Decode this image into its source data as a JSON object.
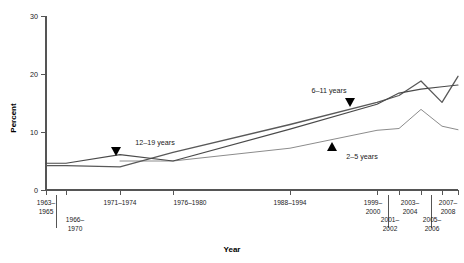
{
  "chart_data": {
    "type": "line",
    "title": "",
    "xlabel": "Year",
    "ylabel": "Percent",
    "ylim": [
      0,
      30
    ],
    "yticks": [
      0,
      10,
      20,
      30
    ],
    "ytick_labels": [
      "0",
      "10",
      "20",
      "30"
    ],
    "grid": false,
    "legend": "inline-annotations",
    "categories": [
      "1963–1965",
      "1966–1970",
      "1971–1974",
      "1976–1980",
      "1988–1994",
      "1999–2000",
      "2001–2002",
      "2003–2004",
      "2005–2006",
      "2007–2008"
    ],
    "xtick_rows": [
      {
        "row": "top",
        "labels": [
          "1963–\n1965",
          "",
          "1971–1974",
          "1976–1980",
          "1988–1994",
          "1999–\n2000",
          "",
          "2003–\n2004",
          "",
          "2007–\n2008"
        ]
      },
      {
        "row": "bottom",
        "labels": [
          "",
          "1966–\n1970",
          "",
          "",
          "",
          "",
          "2001–\n2002",
          "",
          "2005–\n2006",
          ""
        ]
      }
    ],
    "series": [
      {
        "name": "2–5 years",
        "color": "#8c8c8c",
        "label_position": "below-line",
        "marker": "triangle-up",
        "points": [
          {
            "x": "1963–1965",
            "y": null
          },
          {
            "x": "1966–1970",
            "y": null
          },
          {
            "x": "1971–1974",
            "y": 5.0
          },
          {
            "x": "1976–1980",
            "y": 5.0
          },
          {
            "x": "1988–1994",
            "y": 7.2
          },
          {
            "x": "1999–2000",
            "y": 10.3
          },
          {
            "x": "2001–2002",
            "y": 10.6
          },
          {
            "x": "2003–2004",
            "y": 13.9
          },
          {
            "x": "2005–2006",
            "y": 11.0
          },
          {
            "x": "2007–2008",
            "y": 10.4
          }
        ]
      },
      {
        "name": "6–11 years",
        "color": "#595959",
        "label_position": "above-line",
        "marker": "triangle-down",
        "points": [
          {
            "x": "1963–1965",
            "y": 4.2
          },
          {
            "x": "1966–1970",
            "y": 4.2
          },
          {
            "x": "1971–1974",
            "y": 4.0
          },
          {
            "x": "1976–1980",
            "y": 6.5
          },
          {
            "x": "1988–1994",
            "y": 11.3
          },
          {
            "x": "1999–2000",
            "y": 15.1
          },
          {
            "x": "2001–2002",
            "y": 16.3
          },
          {
            "x": "2003–2004",
            "y": 18.8
          },
          {
            "x": "2005–2006",
            "y": 15.1
          },
          {
            "x": "2007–2008",
            "y": 19.6
          }
        ]
      },
      {
        "name": "12–19 years",
        "color": "#4a4a4a",
        "label_position": "above-line",
        "marker": "triangle-down",
        "points": [
          {
            "x": "1963–1965",
            "y": 4.6
          },
          {
            "x": "1966–1970",
            "y": 4.6
          },
          {
            "x": "1971–1974",
            "y": 6.1
          },
          {
            "x": "1976–1980",
            "y": 5.0
          },
          {
            "x": "1988–1994",
            "y": 10.5
          },
          {
            "x": "1999–2000",
            "y": 14.8
          },
          {
            "x": "2001–2002",
            "y": 16.7
          },
          {
            "x": "2003–2004",
            "y": 17.4
          },
          {
            "x": "2005–2006",
            "y": 17.8
          },
          {
            "x": "2007–2008",
            "y": 18.1
          }
        ]
      }
    ],
    "annotations": [
      {
        "text": "12–19 years",
        "x": 150,
        "y": 147,
        "marker_x": 116,
        "marker_y": 152,
        "marker": "triangle-down"
      },
      {
        "text": "6–11 years",
        "x": 329,
        "y": 95,
        "marker_x": 350,
        "marker_y": 104,
        "marker": "triangle-down"
      },
      {
        "text": "2–5 years",
        "x": 360,
        "y": 156,
        "marker_x": 332,
        "marker_y": 146,
        "marker": "triangle-up"
      }
    ],
    "colors": {
      "axis": "#555555",
      "text": "#1a1a1a",
      "series_2_5": "#8c8c8c",
      "series_6_11": "#595959",
      "series_12_19": "#4a4a4a"
    }
  }
}
